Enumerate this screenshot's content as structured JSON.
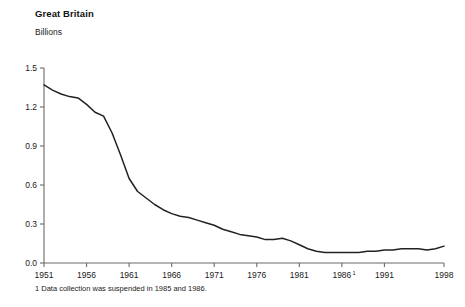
{
  "chart_data": {
    "type": "line",
    "title": "Great Britain",
    "subtitle": "Billions",
    "xlabel": "",
    "ylabel": "Billions",
    "xlim": [
      1951,
      1998
    ],
    "ylim": [
      0.0,
      1.5
    ],
    "grid": false,
    "legend": null,
    "line_color": "#222222",
    "axis_color": "#6b6b6b",
    "xticks": [
      1951,
      1956,
      1961,
      1966,
      1971,
      1976,
      1981,
      1986,
      1991,
      1998
    ],
    "xtick_labels": [
      "1951",
      "1956",
      "1961",
      "1966",
      "1971",
      "1976",
      "1981",
      "1986",
      "1991",
      "1998"
    ],
    "xtick_superscripts": [
      "",
      "",
      "",
      "",
      "",
      "",
      "",
      "1",
      "",
      ""
    ],
    "yticks": [
      0.0,
      0.3,
      0.6,
      0.9,
      1.2,
      1.5
    ],
    "ytick_labels": [
      "0.0",
      "0.3",
      "0.6",
      "0.9",
      "1.2",
      "1.5"
    ],
    "footnote": "1 Data collection was suspended in 1985 and 1986.",
    "x": [
      1951,
      1952,
      1953,
      1954,
      1955,
      1956,
      1957,
      1958,
      1959,
      1960,
      1961,
      1962,
      1963,
      1964,
      1965,
      1966,
      1967,
      1968,
      1969,
      1970,
      1971,
      1972,
      1973,
      1974,
      1975,
      1976,
      1977,
      1978,
      1979,
      1980,
      1981,
      1982,
      1983,
      1984,
      1987,
      1988,
      1989,
      1990,
      1991,
      1992,
      1993,
      1994,
      1995,
      1996,
      1997,
      1998
    ],
    "values": [
      1.37,
      1.33,
      1.3,
      1.28,
      1.27,
      1.22,
      1.16,
      1.13,
      1.0,
      0.83,
      0.65,
      0.55,
      0.5,
      0.45,
      0.41,
      0.38,
      0.36,
      0.35,
      0.33,
      0.31,
      0.29,
      0.26,
      0.24,
      0.22,
      0.21,
      0.2,
      0.18,
      0.18,
      0.19,
      0.17,
      0.14,
      0.11,
      0.09,
      0.08,
      0.08,
      0.08,
      0.09,
      0.09,
      0.1,
      0.1,
      0.11,
      0.11,
      0.11,
      0.1,
      0.11,
      0.13
    ]
  }
}
